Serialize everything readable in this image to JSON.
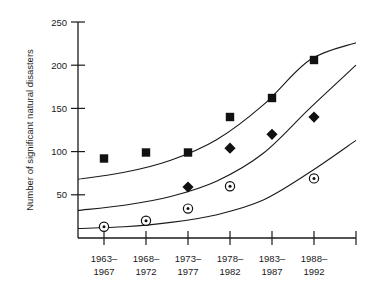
{
  "chart_data": {
    "type": "scatter",
    "title": "",
    "xlabel": "",
    "ylabel": "Number of significant natural disasters",
    "ylim": [
      0,
      250
    ],
    "yticks": [
      50,
      100,
      150,
      200,
      250
    ],
    "ytick_labels": [
      "50",
      "100",
      "150",
      "200",
      "250"
    ],
    "grid": false,
    "legend": false,
    "categories": [
      "1963–1967",
      "1968–1972",
      "1973–1977",
      "1978–1982",
      "1983–1987",
      "1988–1992"
    ],
    "category_lines": [
      [
        "1963–",
        "1967"
      ],
      [
        "1968–",
        "1972"
      ],
      [
        "1973–",
        "1977"
      ],
      [
        "1978–",
        "1982"
      ],
      [
        "1983–",
        "1987"
      ],
      [
        "1988–",
        "1992"
      ]
    ],
    "series": [
      {
        "name": "upper-series",
        "marker": "filled-square",
        "values": [
          92,
          99,
          99,
          140,
          162,
          206
        ],
        "fit_curve": [
          68,
          76,
          90,
          114,
          154,
          206,
          226
        ]
      },
      {
        "name": "middle-series",
        "marker": "filled-diamond",
        "values": [
          null,
          null,
          59,
          104,
          120,
          140
        ],
        "fit_curve": [
          32,
          38,
          48,
          66,
          98,
          150,
          200
        ]
      },
      {
        "name": "lower-series",
        "marker": "circle-with-dot",
        "values": [
          13,
          20,
          34,
          60,
          null,
          69
        ],
        "fit_curve": [
          11,
          13,
          18,
          27,
          44,
          76,
          113
        ]
      }
    ]
  },
  "colors": {
    "ink": "#1a1a1a",
    "marker": "#111111",
    "background": "#ffffff"
  }
}
